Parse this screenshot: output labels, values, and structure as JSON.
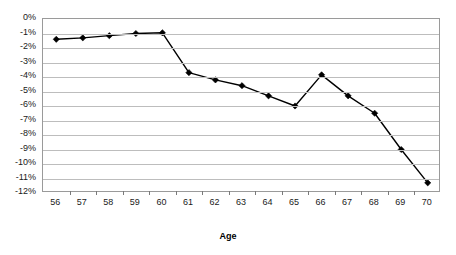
{
  "chart_data": {
    "type": "line",
    "title": "",
    "xlabel": "Age",
    "ylabel": "",
    "categories": [
      56,
      57,
      58,
      59,
      60,
      61,
      62,
      63,
      64,
      65,
      66,
      67,
      68,
      69,
      70
    ],
    "x_tick_labels": [
      "56",
      "57",
      "58",
      "59",
      "60",
      "61",
      "62",
      "63",
      "64",
      "65",
      "66",
      "67",
      "68",
      "69",
      "70"
    ],
    "values": [
      -1.4,
      -1.3,
      -1.15,
      -1.0,
      -0.95,
      -3.7,
      -4.2,
      -4.6,
      -5.3,
      -6.0,
      -3.85,
      -5.3,
      -6.5,
      -9.0,
      -11.3
    ],
    "y_tick_labels": [
      "0%",
      "-1%",
      "-2%",
      "-3%",
      "-4%",
      "-5%",
      "-6%",
      "-7%",
      "-8%",
      "-9%",
      "-10%",
      "-11%",
      "-12%"
    ],
    "y_tick_values": [
      0,
      -1,
      -2,
      -3,
      -4,
      -5,
      -6,
      -7,
      -8,
      -9,
      -10,
      -11,
      -12
    ],
    "ylim": [
      -12,
      0
    ],
    "grid": true,
    "legend": "none",
    "marker": "diamond",
    "series_color": "#000000",
    "grid_color": "#bdbdbd",
    "frame_color": "#9a9a9a"
  }
}
